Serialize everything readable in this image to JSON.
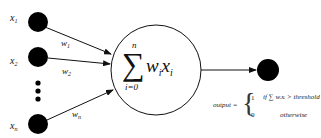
{
  "diagram": {
    "inputs": [
      {
        "label": "x",
        "sub": "1",
        "weight": "w",
        "weight_sub": "1"
      },
      {
        "label": "x",
        "sub": "2",
        "weight": "w",
        "weight_sub": "2"
      },
      {
        "label": "x",
        "sub": "n",
        "weight": "w",
        "weight_sub": "n"
      }
    ],
    "summation": {
      "symbol": "∑",
      "upper": "n",
      "lower": "i=0",
      "w": "w",
      "w_sub": "i",
      "x": "x",
      "x_sub": "i"
    },
    "output_equation": {
      "lhs": "output =",
      "case1_value": "1",
      "case1_condition": "if ∑ wᵢxᵢ > threshold",
      "case0_value": "0",
      "case0_condition": "otherwise"
    },
    "colors": {
      "node_fill": "#000000",
      "stroke": "#111111",
      "background": "#ffffff"
    }
  }
}
